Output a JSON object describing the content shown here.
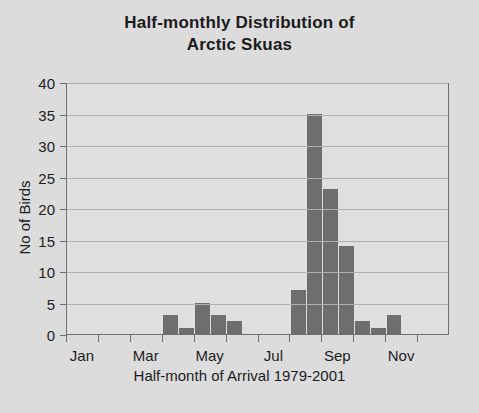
{
  "chart_data": {
    "type": "bar",
    "title": "Half-monthly Distribution of Arctic Skuas",
    "title_lines": [
      "Half-monthly Distribution of",
      "Arctic Skuas"
    ],
    "xlabel": "Half-month of Arrival 1979-2001",
    "ylabel": "No of Birds",
    "ylim": [
      0,
      40
    ],
    "ytick_step": 5,
    "yticks": [
      0,
      5,
      10,
      15,
      20,
      25,
      30,
      35,
      40
    ],
    "grid": true,
    "legend": null,
    "bar_color": "#6e6e6e",
    "plot_background": "#dfdfdf",
    "figure_background": "#dadada",
    "axis_color": "#6f6f6f",
    "gridline_color": "#b0b0b0",
    "text_color": "#1d1d1d",
    "categories": [
      "Jan 1",
      "Jan 2",
      "Feb 1",
      "Feb 2",
      "Mar 1",
      "Mar 2",
      "Apr 1",
      "Apr 2",
      "May 1",
      "May 2",
      "Jun 1",
      "Jun 2",
      "Jul 1",
      "Jul 2",
      "Aug 1",
      "Aug 2",
      "Sep 1",
      "Sep 2",
      "Oct 1",
      "Oct 2",
      "Nov 1",
      "Nov 2",
      "Dec 1",
      "Dec 2"
    ],
    "values": [
      0,
      0,
      0,
      0,
      0,
      0,
      3,
      1,
      5,
      3,
      2,
      0,
      0,
      0,
      7,
      35,
      23,
      14,
      2,
      1,
      3,
      0,
      0,
      0
    ],
    "xtick_labels": [
      "Jan",
      "Mar",
      "May",
      "Jul",
      "Sep",
      "Nov"
    ],
    "xtick_categories": [
      "Jan 1",
      "Mar 1",
      "May 1",
      "Jul 1",
      "Sep 1",
      "Nov 1"
    ],
    "xtick_mark_count": 12
  }
}
